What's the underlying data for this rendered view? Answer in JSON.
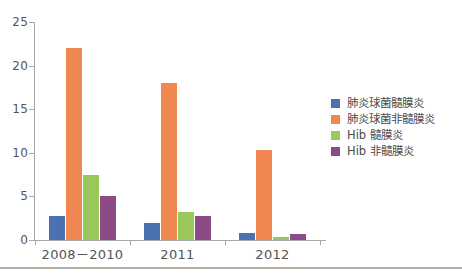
{
  "chart_data": {
    "type": "bar",
    "title": "",
    "subtitle": "",
    "xlabel": "",
    "ylabel": "",
    "ylim": [
      0,
      25
    ],
    "yticks": [
      0,
      5,
      10,
      15,
      20,
      25
    ],
    "grid": false,
    "legend_position": "right",
    "categories": [
      "2008－2010",
      "2011",
      "2012"
    ],
    "series": [
      {
        "name": "肺炎球菌髓膜炎",
        "color": "#4a72b0",
        "values": [
          2.8,
          2.0,
          0.8
        ]
      },
      {
        "name": "肺炎球菌非髓膜炎",
        "color": "#f08650",
        "values": [
          22.0,
          18.0,
          10.3
        ]
      },
      {
        "name": "Hib 髓膜炎",
        "color": "#9bc85a",
        "values": [
          7.5,
          3.2,
          0.3
        ]
      },
      {
        "name": "Hib 非髓膜炎",
        "color": "#8b4b87",
        "values": [
          5.0,
          2.8,
          0.7
        ]
      }
    ]
  },
  "axis": {
    "y_tick_labels": [
      "0",
      "5",
      "10",
      "15",
      "20",
      "25"
    ],
    "x_tick_labels": [
      "2008－2010",
      "2011",
      "2012"
    ]
  },
  "legend": {
    "items": [
      {
        "label": "肺炎球菌髓膜炎",
        "color": "#4a72b0"
      },
      {
        "label": "肺炎球菌非髓膜炎",
        "color": "#f08650"
      },
      {
        "label": "Hib 髓膜炎",
        "color": "#9bc85a"
      },
      {
        "label": "Hib 非髓膜炎",
        "color": "#8b4b87"
      }
    ]
  }
}
